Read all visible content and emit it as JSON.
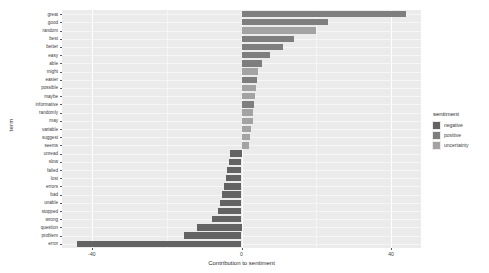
{
  "chart_data": {
    "type": "bar",
    "orientation": "horizontal",
    "title": "",
    "xlabel": "Contribution to sentiment",
    "ylabel": "term",
    "xlim": [
      -48,
      48
    ],
    "xticks": [
      -40,
      0,
      40
    ],
    "xtick_labels": [
      "-40",
      "0",
      "40"
    ],
    "grid": true,
    "legend": {
      "title": "sentiment",
      "position": "right",
      "entries": [
        {
          "label": "negative",
          "color": "#636363"
        },
        {
          "label": "positive",
          "color": "#7e7e7e"
        },
        {
          "label": "uncertainty",
          "color": "#a3a3a3"
        }
      ]
    },
    "categories": [
      "great",
      "good",
      "random",
      "best",
      "better",
      "easy",
      "able",
      "might",
      "easier",
      "possible",
      "maybe",
      "informative",
      "randomly",
      "may",
      "variable",
      "suggest",
      "seems",
      "unread",
      "slow",
      "failed",
      "lost",
      "errors",
      "bad",
      "unable",
      "stopped",
      "wrong",
      "question",
      "problem",
      "error"
    ],
    "values": [
      44,
      23,
      20,
      14,
      11,
      7.5,
      5.5,
      4.5,
      4.2,
      4.0,
      3.6,
      3.4,
      3.2,
      3.0,
      2.6,
      2.4,
      2.0,
      -3.0,
      -3.4,
      -3.8,
      -4.2,
      -4.6,
      -5.2,
      -5.8,
      -6.4,
      -8.0,
      -12.0,
      -15.5,
      -44.0
    ],
    "sentiments": [
      "positive",
      "positive",
      "uncertainty",
      "positive",
      "positive",
      "positive",
      "positive",
      "uncertainty",
      "positive",
      "uncertainty",
      "uncertainty",
      "positive",
      "uncertainty",
      "uncertainty",
      "uncertainty",
      "uncertainty",
      "uncertainty",
      "negative",
      "negative",
      "negative",
      "negative",
      "negative",
      "negative",
      "negative",
      "negative",
      "negative",
      "negative",
      "negative",
      "negative"
    ]
  },
  "axes": {
    "y_title": "term",
    "x_title": "Contribution to sentiment"
  },
  "legend": {
    "title": "sentiment",
    "items": [
      {
        "label": "negative"
      },
      {
        "label": "positive"
      },
      {
        "label": "uncertainty"
      }
    ]
  }
}
